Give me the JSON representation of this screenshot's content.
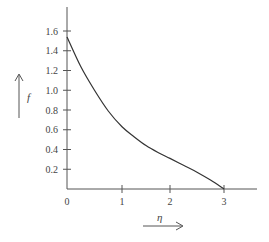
{
  "chart_data": {
    "type": "line",
    "title": "",
    "xlabel": "η",
    "ylabel": "f",
    "xlim": [
      0,
      3.6
    ],
    "ylim": [
      0,
      1.8
    ],
    "grid": false,
    "legend": null,
    "x_ticks": [
      "0",
      "1",
      "2",
      "3"
    ],
    "y_ticks": [
      "0.2",
      "0.4",
      "0.6",
      "0.8",
      "1.0",
      "1.2",
      "1.4",
      "1.6"
    ],
    "series": [
      {
        "name": "f(η)",
        "x": [
          0,
          0.25,
          0.5,
          0.75,
          1.0,
          1.25,
          1.5,
          1.75,
          2.0,
          2.25,
          2.5,
          2.75,
          3.0
        ],
        "y": [
          1.54,
          1.24,
          1.0,
          0.79,
          0.63,
          0.53,
          0.44,
          0.37,
          0.31,
          0.24,
          0.17,
          0.09,
          0.0
        ]
      }
    ],
    "annotations": [
      "arrow pointing up next to f",
      "arrow pointing right under η"
    ]
  },
  "labels": {
    "x_axis": "η",
    "y_axis": "f",
    "x_ticks": [
      "0",
      "1",
      "2",
      "3"
    ],
    "y_ticks": [
      "0.2",
      "0.4",
      "0.6",
      "0.8",
      "1.0",
      "1.2",
      "1.4",
      "1.6"
    ]
  },
  "colors": {
    "axis": "#555555",
    "curve": "#333333",
    "text": "#444444"
  }
}
